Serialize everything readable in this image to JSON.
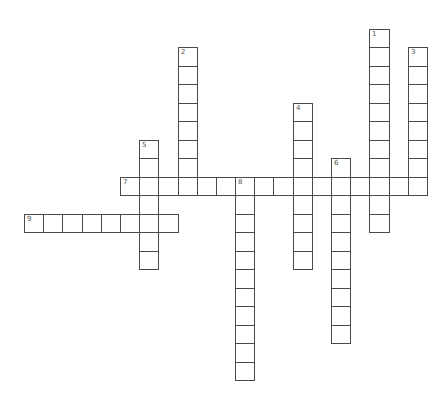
{
  "puzzle": {
    "type": "crossword",
    "layout": {
      "origin_x": 24,
      "origin_y": 28.5,
      "cell_w": 19.19,
      "cell_h": 18.5,
      "cols": 21,
      "rows": 19
    },
    "colors": {
      "line": "#4a4a4a",
      "number": "#555555",
      "background": "#ffffff"
    },
    "entries": [
      {
        "number": "1",
        "direction": "down",
        "col": 18,
        "row": 0,
        "length": 11
      },
      {
        "number": "2",
        "direction": "down",
        "col": 8,
        "row": 1,
        "length": 8
      },
      {
        "number": "3",
        "direction": "down",
        "col": 20,
        "row": 1,
        "length": 8
      },
      {
        "number": "4",
        "direction": "down",
        "col": 14,
        "row": 4,
        "length": 9
      },
      {
        "number": "5",
        "direction": "down",
        "col": 6,
        "row": 6,
        "length": 7
      },
      {
        "number": "6",
        "direction": "down",
        "col": 16,
        "row": 7,
        "length": 10
      },
      {
        "number": "7",
        "direction": "across",
        "col": 5,
        "row": 8,
        "length": 16
      },
      {
        "number": "8",
        "direction": "down",
        "col": 11,
        "row": 8,
        "length": 11
      },
      {
        "number": "9",
        "direction": "across",
        "col": 0,
        "row": 10,
        "length": 8
      }
    ]
  }
}
